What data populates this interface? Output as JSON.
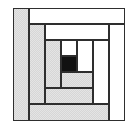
{
  "diagram": {
    "type": "log-cabin-quilt-block",
    "origin": [
      13,
      8
    ],
    "size": [
      112,
      113
    ],
    "colors": {
      "light": "#ffffff",
      "dark": "#d6d6d6",
      "center": "#111111",
      "outline": "#2e2e2e"
    },
    "strips": [
      {
        "id": "left-outer",
        "fill": "gray",
        "x": 0,
        "y": 0,
        "w": 16,
        "h": 113
      },
      {
        "id": "top-outer",
        "fill": "white",
        "x": 16,
        "y": 0,
        "w": 96,
        "h": 16
      },
      {
        "id": "right-outer",
        "fill": "white",
        "x": 96,
        "y": 16,
        "w": 16,
        "h": 97
      },
      {
        "id": "bottom-outer",
        "fill": "gray",
        "x": 16,
        "y": 96,
        "w": 80,
        "h": 17
      },
      {
        "id": "left-mid",
        "fill": "gray",
        "x": 16,
        "y": 16,
        "w": 16,
        "h": 80
      },
      {
        "id": "top-mid",
        "fill": "white",
        "x": 32,
        "y": 16,
        "w": 64,
        "h": 16
      },
      {
        "id": "right-mid",
        "fill": "white",
        "x": 80,
        "y": 32,
        "w": 16,
        "h": 64
      },
      {
        "id": "bottom-mid",
        "fill": "gray",
        "x": 32,
        "y": 80,
        "w": 48,
        "h": 16
      },
      {
        "id": "left-inner",
        "fill": "gray",
        "x": 32,
        "y": 32,
        "w": 16,
        "h": 48
      },
      {
        "id": "top-inner",
        "fill": "white",
        "x": 48,
        "y": 32,
        "w": 16,
        "h": 16
      },
      {
        "id": "right-inner",
        "fill": "white",
        "x": 64,
        "y": 32,
        "w": 16,
        "h": 32
      },
      {
        "id": "bottom-inner",
        "fill": "gray",
        "x": 48,
        "y": 64,
        "w": 32,
        "h": 16
      },
      {
        "id": "center",
        "fill": "black",
        "x": 48,
        "y": 48,
        "w": 16,
        "h": 16
      }
    ]
  }
}
